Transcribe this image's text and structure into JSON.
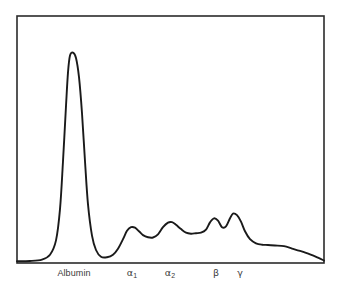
{
  "figure": {
    "kind": "serum-protein-electrophoresis-densitometry-trace",
    "background_color": "#ffffff",
    "frame_color": "#2b2b2b",
    "curve_color": "#1a1a1a",
    "label_color": "#3a3a3a"
  },
  "axis_labels": [
    {
      "id": "albumin",
      "text": "Albumin",
      "base": "Albumin",
      "subscript": "",
      "x_center": 74,
      "y_top": 268
    },
    {
      "id": "alpha1",
      "text": "α1",
      "base": "α",
      "subscript": "1",
      "x_center": 132,
      "y_top": 267
    },
    {
      "id": "alpha2",
      "text": "α2",
      "base": "α",
      "subscript": "2",
      "x_center": 170,
      "y_top": 267
    },
    {
      "id": "beta",
      "text": "β",
      "base": "β",
      "subscript": "",
      "x_center": 216,
      "y_top": 267
    },
    {
      "id": "gamma",
      "text": "γ",
      "base": "γ",
      "subscript": "",
      "x_center": 240,
      "y_top": 267
    }
  ],
  "chart_data": {
    "type": "line",
    "title": "",
    "subtitle": "",
    "xlabel": "",
    "ylabel": "",
    "grid": false,
    "legend": "none",
    "axis_box": {
      "left": 17,
      "top": 16,
      "right": 324,
      "bottom": 263
    },
    "xlim": [
      17,
      324
    ],
    "ylim": [
      0,
      1
    ],
    "fractions": [
      {
        "name": "Albumin",
        "peak_x": 73,
        "peak_height": 0.87,
        "label": "Albumin"
      },
      {
        "name": "Alpha-1 globulin",
        "peak_x": 132,
        "peak_height": 0.145,
        "label": "α1"
      },
      {
        "name": "Alpha-2 globulin",
        "peak_x": 170,
        "peak_height": 0.166,
        "label": "α2"
      },
      {
        "name": "Beta globulin",
        "peak_x": 214,
        "peak_height": 0.182,
        "label": "β"
      },
      {
        "name": "Gamma globulin",
        "peak_x": 233,
        "peak_height": 0.202,
        "label": "γ"
      }
    ],
    "x": [
      17,
      30,
      42,
      50,
      56,
      60,
      63,
      66,
      68,
      70,
      73,
      76,
      79,
      82,
      85,
      88,
      92,
      96,
      101,
      107,
      113,
      118,
      123,
      127,
      131,
      135,
      139,
      143,
      148,
      153,
      158,
      163,
      168,
      172,
      176,
      181,
      186,
      191,
      196,
      201,
      206,
      210,
      214,
      218,
      222,
      226,
      230,
      233,
      237,
      241,
      245,
      250,
      256,
      262,
      268,
      275,
      284,
      292,
      300,
      310,
      318,
      324
    ],
    "y": [
      0.003,
      0.004,
      0.01,
      0.03,
      0.09,
      0.22,
      0.42,
      0.65,
      0.79,
      0.86,
      0.872,
      0.85,
      0.77,
      0.62,
      0.42,
      0.24,
      0.11,
      0.05,
      0.022,
      0.02,
      0.03,
      0.055,
      0.095,
      0.13,
      0.145,
      0.143,
      0.128,
      0.112,
      0.103,
      0.102,
      0.115,
      0.145,
      0.164,
      0.166,
      0.155,
      0.137,
      0.122,
      0.118,
      0.12,
      0.122,
      0.135,
      0.165,
      0.182,
      0.172,
      0.145,
      0.148,
      0.182,
      0.202,
      0.195,
      0.168,
      0.128,
      0.095,
      0.078,
      0.072,
      0.071,
      0.069,
      0.066,
      0.056,
      0.046,
      0.032,
      0.018,
      0.006
    ]
  }
}
